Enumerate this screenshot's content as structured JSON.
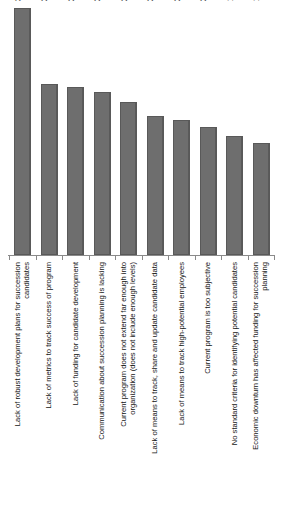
{
  "chart_data": {
    "type": "bar",
    "title": "",
    "subtitle": "",
    "xlabel": "",
    "ylabel": "",
    "ylim": [
      0,
      38.5
    ],
    "grid": false,
    "legend": null,
    "orientation": "vertical",
    "value_label_suffix": "%",
    "bar_color": "#6E6E6E",
    "bar_edge_color": "#595959",
    "axis_color": "#8A8A8A",
    "background": "#FFFFFF",
    "categories": [
      "Lack of robust development plans for succession candidates",
      "Lack of metrics to track success of program",
      "Lack of funding for candidate development",
      "Communication about succession planning is lacking",
      "Current program does not extend far enough into organization (does not include enough levels)",
      "Lack of means to track, share and update candidate data",
      "Lack of means to track high-potential employees",
      "Current program is too subjective",
      "No standard criteria for identifying potential candidates",
      "Economic downturn has affected funding for succession planning"
    ],
    "category_lines": [
      [
        "Lack of robust development plans for succession",
        "candidates"
      ],
      [
        "Lack of metrics to track success of program"
      ],
      [
        "Lack of funding for candidate development"
      ],
      [
        "Communication about succession planning is lacking"
      ],
      [
        "Current program does not extend far enough into",
        "organization (does not include enough levels)"
      ],
      [
        "Lack of means to track, share and update candidate data"
      ],
      [
        "Lack of means to track high-potential employees"
      ],
      [
        "Current program is too subjective"
      ],
      [
        "No standard criteria for identifying potential candidates"
      ],
      [
        "Economic downturn has affected funding for succession",
        "planning"
      ]
    ],
    "values": [
      38.5,
      26.7,
      26.2,
      25.4,
      23.8,
      21.6,
      21.1,
      20.0,
      18.6,
      17.4
    ],
    "value_labels": [
      "38.5%",
      "26.7%",
      "26.2%",
      "25.4%",
      "23.8%",
      "21.6%",
      "21.1%",
      "20.0%",
      "18.6%",
      "17.4%"
    ]
  }
}
